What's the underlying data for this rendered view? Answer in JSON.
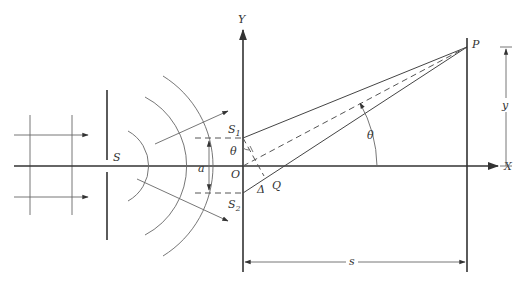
{
  "diagram": {
    "labels": {
      "y_axis": "Y",
      "x_axis": "X",
      "source": "S",
      "slit1_main": "S",
      "slit1_sub": "1",
      "slit2_main": "S",
      "slit2_sub": "2",
      "origin": "O",
      "slit_separation": "a",
      "angle_left": "θ",
      "angle_right": "θ",
      "path_difference": "Δ",
      "foot_point": "Q",
      "screen_point": "P",
      "screen_height": "y",
      "screen_distance": "s"
    },
    "colors": {
      "stroke": "#444444",
      "text": "#333333",
      "background": "#ffffff"
    }
  }
}
